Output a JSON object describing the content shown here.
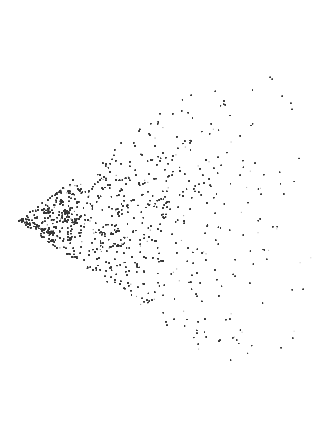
{
  "image": {
    "description": "Wedge-shaped point cloud resembling a galaxy redshift survey slice, densest near the apex on the left and fading to the right",
    "width": 312,
    "height": 436,
    "background": "#ffffff",
    "point_color": "#3a3a3a"
  },
  "wedge": {
    "apex": [
      18,
      220
    ],
    "upper_edge_end": [
      232,
      58
    ],
    "lower_edge_end": [
      238,
      378
    ],
    "max_radius": 300,
    "filament_seeds": 260,
    "points": 52000
  }
}
